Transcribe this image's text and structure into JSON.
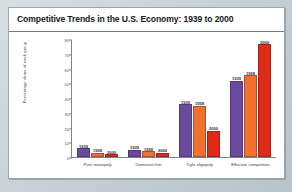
{
  "card": {
    "title": "Competitive Trends in the U.S. Economy: 1939 to 2000"
  },
  "colors": {
    "series_1939": "#6a4a9c",
    "series_1958": "#f0702f",
    "series_2000": "#e02a18",
    "card_background": "#ffffff",
    "page_background": "#c9d2d6",
    "axis": "#7d848b",
    "title_text": "#16171a"
  },
  "chart_data": {
    "type": "bar",
    "title": "Competitive Trends in the U.S. Economy: 1939 to 2000",
    "xlabel": "",
    "ylabel": "Percentage share of each group",
    "ylim": [
      0,
      80
    ],
    "yticks": [
      0,
      10,
      20,
      30,
      40,
      50,
      60,
      70,
      80
    ],
    "grid": false,
    "legend": "none",
    "categories": [
      "Pure monopoly",
      "Dominant firm",
      "Tight oligopoly",
      "Effective competition"
    ],
    "series": [
      {
        "name": "1939",
        "values": [
          6,
          5,
          36,
          52
        ]
      },
      {
        "name": "1958",
        "values": [
          3,
          4,
          35,
          56
        ]
      },
      {
        "name": "2000",
        "values": [
          2,
          3,
          18,
          77
        ]
      }
    ],
    "bar_labels": [
      [
        "1939",
        "1958",
        "2000"
      ],
      [
        "1939",
        "1958",
        "2000"
      ],
      [
        "1939",
        "1958",
        "2000"
      ],
      [
        "1939",
        "1958",
        "2000"
      ]
    ]
  }
}
